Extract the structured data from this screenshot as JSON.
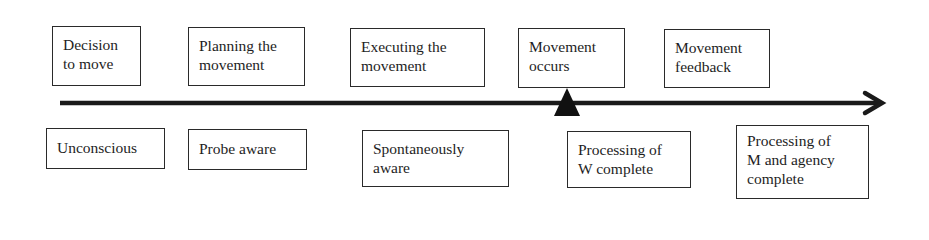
{
  "diagram": {
    "timeline": {
      "direction": "left-to-right",
      "marker": "triangle-marker"
    },
    "top_row": [
      {
        "id": "decision",
        "lines": [
          "Decision",
          "to move"
        ]
      },
      {
        "id": "planning",
        "lines": [
          "Planning the",
          "movement"
        ]
      },
      {
        "id": "executing",
        "lines": [
          "Executing the",
          "movement"
        ]
      },
      {
        "id": "occurs",
        "lines": [
          "Movement",
          "occurs"
        ]
      },
      {
        "id": "feedback",
        "lines": [
          "Movement",
          "feedback"
        ]
      }
    ],
    "bottom_row": [
      {
        "id": "unconscious",
        "lines": [
          "Unconscious"
        ]
      },
      {
        "id": "probe-aware",
        "lines": [
          "Probe aware"
        ]
      },
      {
        "id": "spontaneously-aware",
        "lines": [
          "Spontaneously",
          "aware"
        ]
      },
      {
        "id": "processing-w",
        "lines": [
          "Processing of",
          "W complete"
        ]
      },
      {
        "id": "processing-m",
        "lines": [
          "Processing of",
          "M and agency",
          "complete"
        ]
      }
    ],
    "colors": {
      "line": "#1a1a1a",
      "border": "#2a2a2a",
      "text": "#1e1e1e",
      "background": "#ffffff"
    }
  }
}
